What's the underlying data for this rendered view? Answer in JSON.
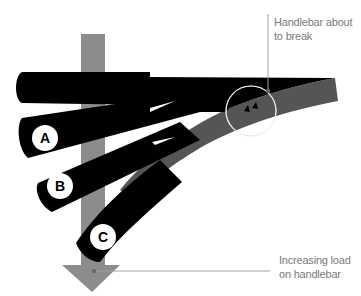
{
  "diagram": {
    "annotations": {
      "break": {
        "line1": "Handlebar about",
        "line2": "to break"
      },
      "load": {
        "line1": "Increasing load",
        "line2": "on handlebar"
      }
    },
    "positions": [
      {
        "id": "A",
        "label": "A"
      },
      {
        "id": "B",
        "label": "B"
      },
      {
        "id": "C",
        "label": "C"
      }
    ],
    "colors": {
      "bar": "#000000",
      "bent_bar": "#555555",
      "load_arrow": "#8c8c8c",
      "leader_line": "#a0a0a0",
      "highlight_circle": "#ffffff",
      "text": "#7a7a7a"
    }
  }
}
